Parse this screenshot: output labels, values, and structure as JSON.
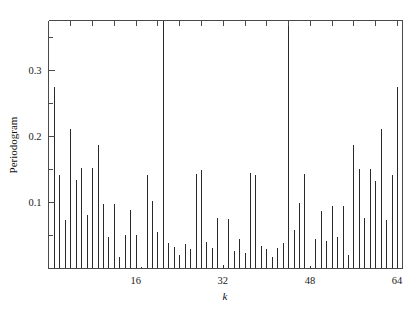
{
  "figure": {
    "name": "periodogram-figure",
    "background_color": "#ffffff",
    "axis_color": "#4a4a4a",
    "spike_color": "#2a2a2a"
  },
  "labels": {
    "ylabel": "Periodogram",
    "xlabel": "k"
  },
  "axes": {
    "x_tick_labels": [
      "16",
      "32",
      "48",
      "64"
    ],
    "y_tick_labels": [
      "0.1",
      "0.2",
      "0.3"
    ]
  },
  "chart_data": {
    "type": "bar",
    "title": "",
    "xlabel": "k",
    "ylabel": "Periodogram",
    "xlim": [
      0,
      65
    ],
    "ylim": [
      0,
      0.375
    ],
    "grid": false,
    "legend": "none",
    "x_ticks_major": [
      16,
      32,
      48,
      64
    ],
    "x_ticks_minor": [
      4,
      8,
      12,
      20,
      24,
      28,
      36,
      40,
      44,
      52,
      56,
      60
    ],
    "y_ticks_major": [
      0.1,
      0.2,
      0.3
    ],
    "y_ticks_minor": [
      0.05,
      0.15,
      0.25,
      0.35
    ],
    "x": [
      1,
      2,
      3,
      4,
      5,
      6,
      7,
      8,
      9,
      10,
      11,
      12,
      13,
      14,
      15,
      16,
      17,
      18,
      19,
      20,
      21,
      22,
      23,
      24,
      25,
      26,
      27,
      28,
      29,
      30,
      31,
      32,
      33,
      34,
      35,
      36,
      37,
      38,
      39,
      40,
      41,
      42,
      43,
      44,
      45,
      46,
      47,
      48,
      49,
      50,
      51,
      52,
      53,
      54,
      55,
      56,
      57,
      58,
      59,
      60,
      61,
      62,
      63,
      64
    ],
    "values": [
      0.274,
      0.142,
      0.073,
      0.211,
      0.134,
      0.152,
      0.081,
      0.152,
      0.187,
      0.097,
      0.047,
      0.097,
      0.018,
      0.05,
      0.089,
      0.05,
      0.003,
      0.142,
      0.102,
      0.055,
      0.375,
      0.038,
      0.033,
      0.02,
      0.037,
      0.029,
      0.143,
      0.149,
      0.04,
      0.031,
      0.076,
      0.005,
      0.075,
      0.027,
      0.044,
      0.024,
      0.144,
      0.141,
      0.034,
      0.03,
      0.017,
      0.031,
      0.038,
      0.375,
      0.058,
      0.099,
      0.143,
      0.004,
      0.044,
      0.087,
      0.042,
      0.095,
      0.047,
      0.094,
      0.02,
      0.186,
      0.15,
      0.077,
      0.151,
      0.133,
      0.211,
      0.073,
      0.142,
      0.274
    ]
  }
}
